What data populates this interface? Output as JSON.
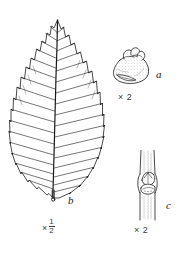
{
  "plate": {
    "kind": "botanical-illustration-plate",
    "style": "pen-and-ink line drawing",
    "background_color": "#ffffff",
    "ink_color": "#1a1a1a",
    "width": 182,
    "height": 259
  },
  "figures": [
    {
      "key": "a",
      "label": "a",
      "scale_text": "× 2",
      "subject": "bud",
      "description": "ovoid bud with overlapping scales at apex",
      "shading": "stippled"
    },
    {
      "key": "b",
      "label": "b",
      "scale_prefix": "×",
      "scale_numerator": "1",
      "scale_denominator": "2",
      "scale_text": "× 1/2",
      "subject": "leaf",
      "description": "elliptic leaf, acuminate apex, serrate margin, pinnate venation, short petiole",
      "vein_pairs": 15
    },
    {
      "key": "c",
      "label": "c",
      "scale_text": "× 2",
      "subject": "twig node",
      "description": "twig segment with lateral bud above leaf scar",
      "shading": "stippled"
    }
  ]
}
